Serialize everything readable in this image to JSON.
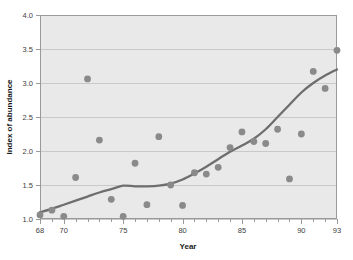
{
  "chart_data": {
    "type": "scatter",
    "title": "",
    "subtitle": "",
    "xlabel": "Year",
    "ylabel": "Index of abundance",
    "xlim": [
      68,
      93
    ],
    "ylim": [
      1.0,
      4.0
    ],
    "grid": true,
    "grid_axis": "y",
    "legend": "none",
    "x_ticks_major": [
      68,
      70,
      75,
      80,
      85,
      90,
      93
    ],
    "x_tick_labels": [
      "68",
      "70",
      "75",
      "80",
      "85",
      "90",
      "93"
    ],
    "x_minor_tick_step": 1,
    "y_ticks": [
      1.0,
      1.5,
      2.0,
      2.5,
      3.0,
      3.5,
      4.0
    ],
    "y_tick_labels": [
      "1.0",
      "1.5",
      "2.0",
      "2.5",
      "3.0",
      "3.5",
      "4.0"
    ],
    "series": [
      {
        "name": "Index of abundance",
        "marker": "circle",
        "color": "#8a8a8a",
        "x": [
          68,
          69,
          70,
          71,
          72,
          73,
          74,
          75,
          76,
          77,
          78,
          79,
          80,
          81,
          82,
          83,
          84,
          85,
          86,
          87,
          88,
          89,
          90,
          91,
          92,
          93
        ],
        "values": [
          1.06,
          1.13,
          1.04,
          1.61,
          3.06,
          2.16,
          1.29,
          1.04,
          1.82,
          1.21,
          2.21,
          1.5,
          1.2,
          1.68,
          1.66,
          1.76,
          2.05,
          2.28,
          2.14,
          2.11,
          2.32,
          1.59,
          2.25,
          3.17,
          2.92,
          3.48
        ]
      },
      {
        "name": "smooth trend",
        "type": "line",
        "color": "#6e6e6e",
        "x": [
          68,
          69,
          70,
          71,
          72,
          73,
          74,
          75,
          76,
          77,
          78,
          79,
          80,
          81,
          82,
          83,
          84,
          85,
          86,
          87,
          88,
          89,
          90,
          91,
          92,
          93
        ],
        "values": [
          1.1,
          1.15,
          1.21,
          1.27,
          1.33,
          1.39,
          1.44,
          1.49,
          1.48,
          1.48,
          1.49,
          1.52,
          1.58,
          1.67,
          1.77,
          1.88,
          1.99,
          2.08,
          2.18,
          2.32,
          2.5,
          2.68,
          2.86,
          3.0,
          3.11,
          3.2
        ]
      }
    ]
  },
  "style": {
    "plot_background": "#e9e9e9",
    "grid_color": "#c9c9c9",
    "axis_color": "#9a9a9a",
    "marker_color": "#8a8a8a",
    "line_color": "#6e6e6e",
    "page_background": "#ffffff",
    "tick_label_color": "#404040",
    "axis_title_color": "#1a1a1a"
  },
  "geometry": {
    "plot_left": 40,
    "plot_right": 337,
    "plot_top": 15,
    "plot_bottom": 219,
    "marker_radius": 3.4,
    "line_width": 2.3
  }
}
